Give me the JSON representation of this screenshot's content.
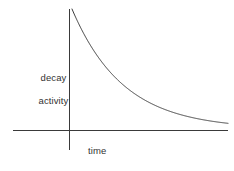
{
  "figure": {
    "background_color": "#ffffff",
    "line_color": "#3a3a3a",
    "text_color": "#333333"
  },
  "labels": {
    "y_axis_line1": "decay",
    "y_axis_line2": "activity",
    "x_axis": "time"
  },
  "chart_data": {
    "type": "line",
    "title": "",
    "xlabel": "time",
    "ylabel": "decay activity",
    "grid": false,
    "legend": null,
    "annotations": [],
    "xticks": [],
    "yticks": [],
    "xlim": [
      0,
      1
    ],
    "ylim": [
      0,
      1
    ],
    "axes_pixels": {
      "origin_x": 69,
      "origin_y": 130,
      "x_axis_left": 13,
      "x_axis_right": 228,
      "y_axis_top": 9,
      "y_axis_bottom": 150
    },
    "series": [
      {
        "name": "decay activity",
        "model": "exponential-decay",
        "equation": "A = A0 * exp(-k * t)",
        "curve_pixels": {
          "start_x": 72,
          "start_y": 9,
          "end_x": 228,
          "end_y": 127,
          "asymptote_y": 129,
          "decay_constant": 3.05
        },
        "x": [
          0.0,
          0.02,
          0.04,
          0.06,
          0.08,
          0.1,
          0.14,
          0.18,
          0.22,
          0.26,
          0.3,
          0.35,
          0.4,
          0.45,
          0.5,
          0.55,
          0.6,
          0.65,
          0.7,
          0.75,
          0.8,
          0.85,
          0.9,
          0.95,
          1.0
        ],
        "values": [
          1.0,
          0.941,
          0.885,
          0.833,
          0.784,
          0.737,
          0.652,
          0.577,
          0.511,
          0.452,
          0.4,
          0.344,
          0.295,
          0.254,
          0.218,
          0.187,
          0.161,
          0.138,
          0.119,
          0.102,
          0.088,
          0.075,
          0.065,
          0.056,
          0.048
        ]
      }
    ]
  }
}
